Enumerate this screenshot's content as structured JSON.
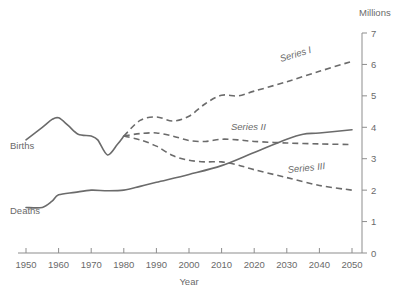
{
  "chart_data": {
    "type": "line",
    "title": "",
    "xlabel": "Year",
    "ylabel": "",
    "unit_label": "Millions",
    "xlim": [
      1950,
      2050
    ],
    "ylim": [
      0,
      7
    ],
    "grid": false,
    "y_axis_position": "right",
    "legend": "inline-labels",
    "xticks": [
      1950,
      1960,
      1970,
      1980,
      1990,
      2000,
      2010,
      2020,
      2030,
      2040,
      2050
    ],
    "xtick_labels": [
      "1950",
      "1960",
      "1970",
      "1980",
      "1990",
      "2000",
      "2010",
      "2020",
      "2030",
      "2040",
      "2050"
    ],
    "yticks": [
      0,
      1,
      2,
      3,
      4,
      5,
      6,
      7
    ],
    "ytick_labels": [
      "0",
      "1",
      "2",
      "3",
      "4",
      "5",
      "6",
      "7"
    ],
    "series": [
      {
        "name": "Births",
        "label": "Births",
        "style": "solid",
        "x": [
          1950,
          1955,
          1958,
          1960,
          1963,
          1966,
          1970,
          1972,
          1975,
          1978,
          1980
        ],
        "values": [
          3.6,
          4.0,
          4.25,
          4.3,
          4.05,
          3.78,
          3.72,
          3.6,
          3.12,
          3.45,
          3.72
        ]
      },
      {
        "name": "Series I",
        "label": "Series I",
        "style": "dashed",
        "x": [
          1980,
          1985,
          1990,
          1995,
          2000,
          2005,
          2010,
          2015,
          2020,
          2030,
          2040,
          2050
        ],
        "values": [
          3.72,
          4.22,
          4.33,
          4.2,
          4.35,
          4.75,
          5.02,
          5.0,
          5.15,
          5.45,
          5.78,
          6.1
        ]
      },
      {
        "name": "Series II",
        "label": "Series II",
        "style": "dashed",
        "x": [
          1980,
          1985,
          1990,
          1995,
          2000,
          2005,
          2010,
          2015,
          2020,
          2030,
          2040,
          2050
        ],
        "values": [
          3.72,
          3.8,
          3.82,
          3.72,
          3.58,
          3.55,
          3.62,
          3.6,
          3.55,
          3.5,
          3.47,
          3.45
        ]
      },
      {
        "name": "Series III",
        "label": "Series III",
        "style": "dashed",
        "x": [
          1980,
          1985,
          1990,
          1995,
          2000,
          2005,
          2010,
          2015,
          2020,
          2030,
          2040,
          2050
        ],
        "values": [
          3.72,
          3.6,
          3.4,
          3.1,
          2.95,
          2.9,
          2.9,
          2.8,
          2.65,
          2.4,
          2.15,
          2.0
        ]
      },
      {
        "name": "Deaths",
        "label": "Deaths",
        "style": "solid",
        "x": [
          1950,
          1955,
          1958,
          1960,
          1965,
          1970,
          1975,
          1980,
          1985,
          1990,
          2000,
          2010,
          2020,
          2030,
          2035,
          2040,
          2050
        ],
        "values": [
          1.45,
          1.45,
          1.65,
          1.85,
          1.93,
          2.0,
          1.98,
          2.0,
          2.12,
          2.25,
          2.5,
          2.78,
          3.2,
          3.62,
          3.78,
          3.82,
          3.92
        ]
      }
    ],
    "annotations": [
      {
        "name": "births-label",
        "text": "Births",
        "x_px": 10,
        "y_px": 149
      },
      {
        "name": "deaths-label",
        "text": "Deaths",
        "x_px": 10,
        "y_px": 214
      },
      {
        "name": "series-1-label",
        "text": "Series I",
        "x_px": 281,
        "y_px": 62,
        "rotation": -17
      },
      {
        "name": "series-2-label",
        "text": "Series II",
        "x_px": 231,
        "y_px": 130
      },
      {
        "name": "series-3-label",
        "text": "Series III",
        "x_px": 288,
        "y_px": 173,
        "rotation": -6
      }
    ],
    "colors": {
      "line": "#6b6b6b",
      "axis": "#8d8d8d",
      "text": "#6a6a6a",
      "background": "#ffffff"
    }
  }
}
